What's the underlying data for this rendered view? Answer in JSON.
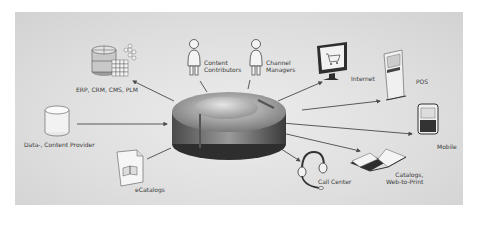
{
  "diagram": {
    "hub": {
      "name": "central-hub",
      "type": "disc"
    },
    "nodes": [
      {
        "id": "erp",
        "label": "ERP, CRM, CMS, PLM",
        "icon": "database-grid-icon",
        "direction": "input"
      },
      {
        "id": "content-contributors",
        "label_line1": "Content",
        "label_line2": "Contributors",
        "icon": "person-icon",
        "direction": "input"
      },
      {
        "id": "channel-managers",
        "label_line1": "Channel",
        "label_line2": "Managers",
        "icon": "person-icon",
        "direction": "input"
      },
      {
        "id": "data-provider",
        "label": "Data-, Content Provider",
        "icon": "database-cylinder-icon",
        "direction": "input"
      },
      {
        "id": "ecatalogs",
        "label": "eCatalogs",
        "icon": "document-book-icon",
        "direction": "output"
      },
      {
        "id": "internet",
        "label": "Internet",
        "icon": "monitor-cart-icon",
        "direction": "output"
      },
      {
        "id": "pos",
        "label": "POS",
        "icon": "kiosk-cart-icon",
        "direction": "output"
      },
      {
        "id": "mobile",
        "label": "Mobile",
        "icon": "smartphone-icon",
        "direction": "output"
      },
      {
        "id": "catalogs",
        "label_line1": "Catalogs,",
        "label_line2": "Web-to-Print",
        "icon": "open-book-icon",
        "direction": "output"
      },
      {
        "id": "call-center",
        "label": "Call Center",
        "icon": "headset-icon",
        "direction": "output"
      }
    ],
    "colors": {
      "background": "#dcdcdc",
      "hub_dark": "#3e3e3e",
      "hub_light": "#bdbdbd",
      "line": "#4a4a4a",
      "text": "#3a3a3a"
    }
  }
}
